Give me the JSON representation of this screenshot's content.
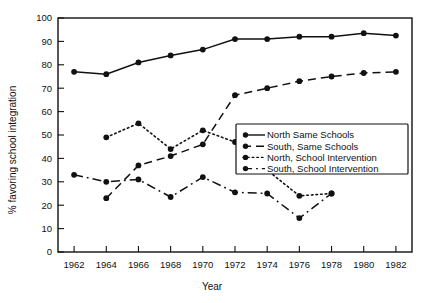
{
  "chart_data": {
    "type": "line",
    "title": "",
    "xlabel": "Year",
    "ylabel": "% favoring school integration",
    "xlim": [
      1961,
      1983
    ],
    "ylim": [
      0,
      100
    ],
    "grid": false,
    "legend_position": "center-right",
    "x_ticks": [
      "1962",
      "1964",
      "1966",
      "1968",
      "1970",
      "1972",
      "1974",
      "1976",
      "1978",
      "1980",
      "1982"
    ],
    "y_ticks": [
      "0",
      "10",
      "20",
      "30",
      "40",
      "50",
      "60",
      "70",
      "80",
      "90",
      "100"
    ],
    "x": [
      1962,
      1964,
      1966,
      1968,
      1970,
      1972,
      1974,
      1976,
      1978,
      1980,
      1982
    ],
    "series": [
      {
        "name": "North Same Schools",
        "style": "solid",
        "marker": "filled-circle",
        "x": [
          1962,
          1964,
          1966,
          1968,
          1970,
          1972,
          1974,
          1976,
          1978,
          1980,
          1982
        ],
        "values": [
          77,
          76,
          81,
          84,
          86.5,
          91,
          91,
          92,
          92,
          93.5,
          92.5
        ]
      },
      {
        "name": "South, Same Schools",
        "style": "dashed",
        "marker": "filled-circle",
        "x": [
          1964,
          1966,
          1968,
          1970,
          1972,
          1974,
          1976,
          1978,
          1980,
          1982
        ],
        "values": [
          23,
          37,
          41,
          46,
          67,
          70,
          73,
          75,
          76.5,
          77
        ]
      },
      {
        "name": "North, School Intervention",
        "style": "dotted",
        "marker": "filled-circle",
        "x": [
          1964,
          1966,
          1968,
          1970,
          1972,
          1974,
          1976,
          1978
        ],
        "values": [
          49,
          55,
          44,
          52,
          47,
          35,
          24,
          25
        ]
      },
      {
        "name": "South, School Intervention",
        "style": "dash-dot",
        "marker": "filled-circle",
        "x": [
          1962,
          1964,
          1966,
          1968,
          1970,
          1972,
          1974,
          1976,
          1978
        ],
        "values": [
          33,
          30,
          31,
          23.5,
          32,
          25.5,
          25,
          14.5,
          25
        ]
      }
    ],
    "legend_entries": [
      "North Same Schools",
      "South, Same Schools",
      "North, School Intervention",
      "South, School Intervention"
    ]
  }
}
